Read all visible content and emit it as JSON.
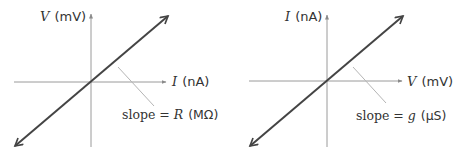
{
  "figures": [
    {
      "id": "resistance",
      "y_axis": {
        "var": "V",
        "unit": "(mV)"
      },
      "x_axis": {
        "var": "I",
        "unit": "(nA)"
      },
      "slope_label": {
        "prefix": "slope = ",
        "var": "R",
        "unit": "(MΩ)"
      }
    },
    {
      "id": "conductance",
      "y_axis": {
        "var": "I",
        "unit": "(nA)"
      },
      "x_axis": {
        "var": "V",
        "unit": "(mV)"
      },
      "slope_label": {
        "prefix": "slope = ",
        "var": "g",
        "unit": "(µS)"
      }
    }
  ],
  "colors": {
    "line": "#444444",
    "axis": "#9a9a9a",
    "leader": "#b5b5b5",
    "text": "#333333"
  }
}
